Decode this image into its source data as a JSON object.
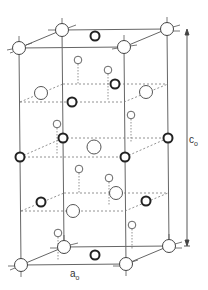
{
  "figure": {
    "type": "crystal-structure-unit-cell",
    "labels": {
      "c_axis": "c",
      "c_axis_subscript": "o",
      "a_axis": "a",
      "a_axis_subscript": "o"
    },
    "colors": {
      "line": "#555555",
      "atom_stroke": "#444444",
      "bold_atom_stroke": "#222222",
      "background": "#ffffff"
    }
  }
}
